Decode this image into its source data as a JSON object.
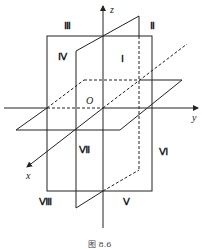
{
  "figure": {
    "caption": "图 8.6",
    "axes": {
      "x": "x",
      "y": "y",
      "z": "z",
      "origin": "O"
    },
    "octants": [
      {
        "label": "Ⅰ",
        "x": 121,
        "y": 62
      },
      {
        "label": "Ⅱ",
        "x": 150,
        "y": 29
      },
      {
        "label": "Ⅲ",
        "x": 64,
        "y": 29
      },
      {
        "label": "Ⅳ",
        "x": 58,
        "y": 60
      },
      {
        "label": "Ⅴ",
        "x": 123,
        "y": 205
      },
      {
        "label": "Ⅵ",
        "x": 159,
        "y": 155
      },
      {
        "label": "Ⅶ",
        "x": 79,
        "y": 153
      },
      {
        "label": "Ⅷ",
        "x": 39,
        "y": 205
      }
    ],
    "colors": {
      "line": "#222222",
      "background": "#ffffff"
    }
  }
}
